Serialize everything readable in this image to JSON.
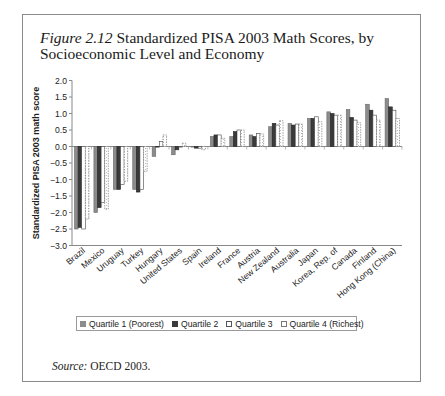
{
  "figure": {
    "number_label": "Figure 2.12",
    "title_text": "Standardized PISA 2003 Math Scores, by Socioeconomic Level and Economy",
    "source_label": "Source:",
    "source_text": "OECD 2003."
  },
  "legend": {
    "items": [
      {
        "label": "Quartile 1 (Poorest)",
        "swatch": "solid-gray"
      },
      {
        "label": "Quartile 2",
        "swatch": "solid-dark"
      },
      {
        "label": "Quartile 3",
        "swatch": "white"
      },
      {
        "label": "Quartile 4 (Richest)",
        "swatch": "dashed-white"
      }
    ]
  },
  "colors": {
    "q1": "#8c8c8c",
    "q2": "#3a3a3a",
    "q3": "#ffffff",
    "q4": "#ffffff",
    "outline": "#555555",
    "axis": "#888888"
  },
  "chart_data": {
    "type": "bar",
    "title": "Figure 2.12 Standardized PISA 2003 Math Scores, by Socioeconomic Level and Economy",
    "xlabel": "",
    "ylabel": "Standardized PISA 2003 math score",
    "ylim": [
      -3.0,
      2.0
    ],
    "yticks": [
      2.0,
      1.5,
      1.0,
      0.5,
      0.0,
      -0.5,
      -1.0,
      -1.5,
      -2.0,
      -2.5,
      -3.0
    ],
    "ytick_labels": [
      "2.0",
      "1.5",
      "1.0",
      "0.5",
      "0.0",
      "−0.5",
      "−1.0",
      "−1.5",
      "−2.0",
      "−2.5",
      "−3.0"
    ],
    "grid": false,
    "legend_position": "bottom",
    "categories": [
      "Brazil",
      "Mexico",
      "Uruguay",
      "Turkey",
      "Hungary",
      "United States",
      "Spain",
      "Ireland",
      "France",
      "Austria",
      "New Zealand",
      "Australia",
      "Japan",
      "Korea, Rep. of",
      "Canada",
      "Finland",
      "Hong Kong (China)"
    ],
    "series": [
      {
        "name": "Quartile 1 (Poorest)",
        "values": [
          -2.5,
          -2.0,
          -1.3,
          -1.3,
          -0.3,
          -0.25,
          0.0,
          0.3,
          0.3,
          0.35,
          0.6,
          0.7,
          0.85,
          1.05,
          1.12,
          1.28,
          1.45
        ]
      },
      {
        "name": "Quartile 2",
        "values": [
          -2.45,
          -1.85,
          -1.3,
          -1.38,
          0.0,
          -0.1,
          -0.05,
          0.35,
          0.45,
          0.3,
          0.7,
          0.65,
          0.85,
          1.0,
          0.88,
          1.1,
          1.2
        ]
      },
      {
        "name": "Quartile 3",
        "values": [
          -2.5,
          -1.7,
          -1.15,
          -1.3,
          0.15,
          0.0,
          -0.05,
          0.35,
          0.5,
          0.4,
          0.65,
          0.68,
          0.9,
          0.95,
          0.8,
          0.95,
          1.1
        ]
      },
      {
        "name": "Quartile 4 (Richest)",
        "values": [
          -2.2,
          -1.9,
          -1.05,
          -0.75,
          0.35,
          0.1,
          -0.1,
          0.25,
          0.5,
          0.38,
          0.78,
          0.68,
          0.75,
          0.95,
          0.72,
          0.8,
          0.85
        ]
      }
    ]
  }
}
